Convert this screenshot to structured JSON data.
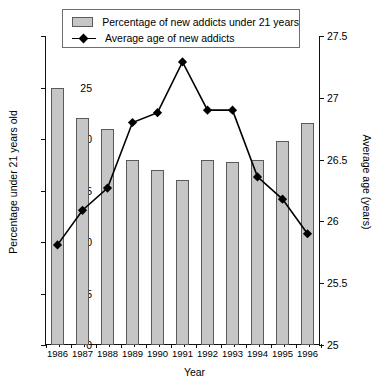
{
  "legend": {
    "items": [
      {
        "label": "Percentage of new addicts under 21 years",
        "icon": "bar-swatch",
        "color": "#c6c6c6"
      },
      {
        "label": "Average age of new addicts",
        "icon": "line-diamond-marker",
        "color": "#000000"
      }
    ]
  },
  "axes": {
    "x_title": "Year",
    "y_left_title": "Percentage under 21 years old",
    "y_right_title": "Average age (years)",
    "y_left_ticks": [
      "0",
      "5",
      "10",
      "15",
      "20",
      "25",
      "30"
    ],
    "y_right_ticks": [
      "25",
      "25.5",
      "26",
      "26.5",
      "27",
      "27.5"
    ],
    "x_ticks": [
      "1986",
      "1987",
      "1988",
      "1989",
      "1990",
      "1991",
      "1992",
      "1993",
      "1994",
      "1995",
      "1996"
    ]
  },
  "chart_data": {
    "type": "bar",
    "title": "",
    "xlabel": "Year",
    "ylabel": "Percentage under 21 years old",
    "y2label": "Average age (years)",
    "categories": [
      "1986",
      "1987",
      "1988",
      "1989",
      "1990",
      "1991",
      "1992",
      "1993",
      "1994",
      "1995",
      "1996"
    ],
    "ylim": [
      0,
      30
    ],
    "y2lim": [
      25,
      27.5
    ],
    "yticks": [
      0,
      5,
      10,
      15,
      20,
      25,
      30
    ],
    "y2ticks": [
      25,
      25.5,
      26,
      26.5,
      27,
      27.5
    ],
    "grid": false,
    "legend_position": "top",
    "series": [
      {
        "name": "Percentage of new addicts under 21 years",
        "type": "bar",
        "axis": "left",
        "color": "#c6c6c6",
        "values": [
          25.0,
          22.0,
          21.0,
          18.0,
          17.0,
          16.0,
          18.0,
          17.8,
          18.0,
          19.8,
          21.6
        ]
      },
      {
        "name": "Average age of new addicts",
        "type": "line",
        "axis": "right",
        "color": "#000000",
        "marker": "diamond",
        "values": [
          25.81,
          26.09,
          26.27,
          26.8,
          26.88,
          27.29,
          26.9,
          26.9,
          26.36,
          26.18,
          25.9
        ]
      }
    ]
  }
}
